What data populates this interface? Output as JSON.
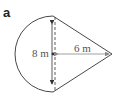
{
  "figure": {
    "label": "a",
    "diameter_label": "8 m",
    "slant_label": "6 m",
    "shape": "semicircle attached to isosceles triangle (kite/cone-like composite)",
    "colors": {
      "stroke": "#333333",
      "arrow": "#777777"
    }
  }
}
